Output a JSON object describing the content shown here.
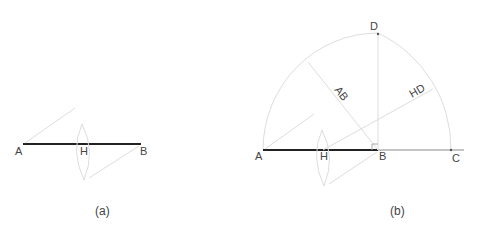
{
  "figure_a": {
    "caption": "(a)",
    "points": {
      "A": "A",
      "H": "H",
      "B": "B"
    }
  },
  "figure_b": {
    "caption": "(b)",
    "points": {
      "A": "A",
      "H": "H",
      "B": "B",
      "C": "C",
      "D": "D"
    },
    "segment_labels": {
      "AB": "AB",
      "HD": "HD"
    }
  },
  "colors": {
    "main_line": "#222222",
    "construction": "#d8d8d8",
    "baseline": "#888888",
    "text": "#444444"
  }
}
